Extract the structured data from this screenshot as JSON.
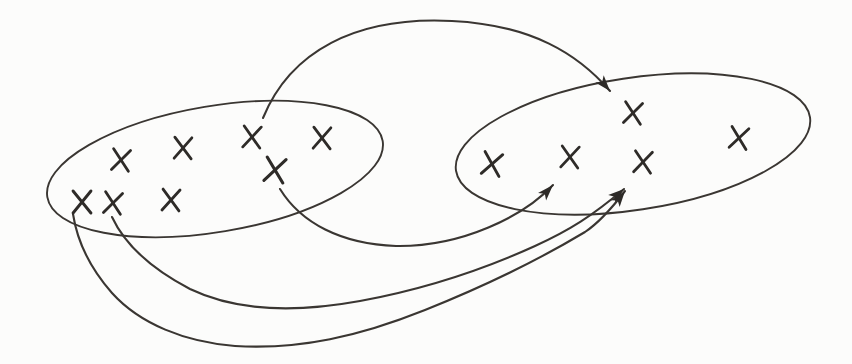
{
  "canvas": {
    "width": 852,
    "height": 364,
    "background": "#fcfcfb",
    "ink": "#2e2b28",
    "curve_ink": "#3a3632",
    "ellipse_stroke_width": 1.9,
    "arrow_stroke_width": 2.1,
    "mark_stroke_width": 2.8
  },
  "diagram": {
    "type": "set-mapping",
    "ellipses": [
      {
        "name": "domain-ellipse",
        "cx": 215,
        "cy": 169,
        "rx": 170,
        "ry": 63,
        "rotate": -9.5
      },
      {
        "name": "codomain-ellipse",
        "cx": 633,
        "cy": 144,
        "rx": 179,
        "ry": 66,
        "rotate": -8.6
      }
    ],
    "marks": {
      "glyph": "x-cross",
      "half_width": 8.5,
      "half_height": 10.5,
      "domain": [
        {
          "x": 121,
          "y": 160,
          "r": 6,
          "s": 1
        },
        {
          "x": 183,
          "y": 148,
          "r": 2,
          "s": 1
        },
        {
          "x": 252,
          "y": 137,
          "r": 4,
          "s": 1
        },
        {
          "x": 322,
          "y": 138,
          "r": 2,
          "s": 1
        },
        {
          "x": 275,
          "y": 170,
          "r": 8,
          "s": 1.12
        },
        {
          "x": 82,
          "y": 202,
          "r": 0,
          "s": 1.05
        },
        {
          "x": 113,
          "y": 203,
          "r": 6,
          "s": 1
        },
        {
          "x": 171,
          "y": 200,
          "r": 3,
          "s": 1
        }
      ],
      "codomain": [
        {
          "x": 633,
          "y": 113,
          "r": 6,
          "s": 1
        },
        {
          "x": 492,
          "y": 164,
          "r": 10,
          "s": 1.05
        },
        {
          "x": 570,
          "y": 157,
          "r": 4,
          "s": 1
        },
        {
          "x": 643,
          "y": 162,
          "r": 5,
          "s": 1
        },
        {
          "x": 739,
          "y": 138,
          "r": 8,
          "s": 1
        }
      ]
    },
    "arrowhead": {
      "length": 16,
      "width": 11,
      "notch": 4
    },
    "arrows": [
      {
        "name": "arrow-top-arc",
        "d": "M 263 118 C 290 52, 355 16, 452 21 C 532 25, 578 54, 610 91"
      },
      {
        "name": "arrow-middle",
        "d": "M 280 189 C 301 223, 341 244, 396 246 C 462 247, 524 216, 553 185"
      },
      {
        "name": "arrow-low-upper",
        "d": "M 112 217 C 125 245, 150 268, 190 289 C 240 313, 300 312, 360 301 C 420 290, 480 271, 535 246 C 570 230, 592 216, 624 189"
      },
      {
        "name": "arrow-low-lower",
        "d": "M 73 214 C 77 240, 90 268, 112 293 C 140 324, 185 342, 235 346 C 300 350, 360 336, 425 310 C 490 284, 545 256, 585 232 C 600 222, 612 208, 625 191"
      }
    ]
  }
}
